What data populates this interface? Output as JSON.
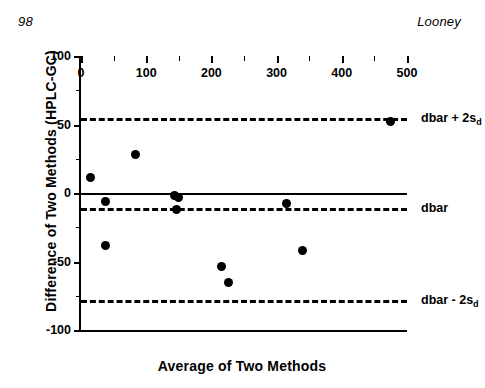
{
  "page": {
    "folio": "98",
    "running_head_author": "Looney"
  },
  "chart_data": {
    "type": "scatter",
    "title": "",
    "xlabel": "Average of Two Methods",
    "ylabel": "Difference of Two Methods (HPLC-GC)",
    "xlim": [
      0,
      500
    ],
    "ylim": [
      -100,
      100
    ],
    "xticks": [
      0,
      100,
      200,
      300,
      400,
      500
    ],
    "xtick_labels": [
      "0",
      "100",
      "200",
      "300",
      "400",
      "500"
    ],
    "xticks_minor": [
      50,
      150,
      250,
      350,
      450
    ],
    "yticks": [
      100,
      50,
      0,
      -50,
      -100
    ],
    "ytick_labels": [
      "100",
      "50",
      "0",
      "-50",
      "-100"
    ],
    "yticks_minor": [
      75,
      25,
      -25,
      -75
    ],
    "grid": false,
    "legend": "none",
    "marker": "filled-circle",
    "marker_color": "#000000",
    "points": [
      {
        "x": 15,
        "y": 11
      },
      {
        "x": 37,
        "y": -6
      },
      {
        "x": 38,
        "y": -38
      },
      {
        "x": 83,
        "y": 28
      },
      {
        "x": 143,
        "y": -2
      },
      {
        "x": 150,
        "y": -3
      },
      {
        "x": 146,
        "y": -12
      },
      {
        "x": 215,
        "y": -54
      },
      {
        "x": 226,
        "y": -65
      },
      {
        "x": 315,
        "y": -8
      },
      {
        "x": 340,
        "y": -42
      },
      {
        "x": 474,
        "y": 52
      }
    ],
    "reference_lines": [
      {
        "name": "upper-limit-of-agreement",
        "y": 55,
        "style": "dashed",
        "label": "dbar + 2s",
        "label_sub": "d"
      },
      {
        "name": "zero-line",
        "y": 0,
        "style": "solid",
        "label": "",
        "label_sub": ""
      },
      {
        "name": "mean-difference",
        "y": -11,
        "style": "dashed",
        "label": "dbar",
        "label_sub": ""
      },
      {
        "name": "lower-limit-of-agreement",
        "y": -78,
        "style": "dashed",
        "label": "dbar - 2s",
        "label_sub": "d"
      }
    ]
  }
}
